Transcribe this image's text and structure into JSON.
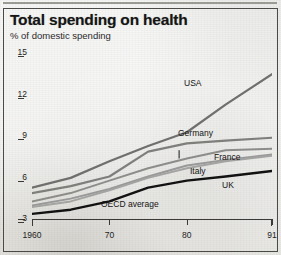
{
  "header": {
    "title": "Total spending on health",
    "subtitle": "% of domestic spending"
  },
  "chart_data": {
    "type": "line",
    "title": "Total spending on health",
    "subtitle": "% of domestic spending",
    "xlabel": "",
    "ylabel": "% of domestic spending",
    "xlim": [
      1960,
      1991
    ],
    "ylim": [
      3,
      15
    ],
    "yticks": [
      15,
      12,
      9,
      6,
      3
    ],
    "ytick_labels": [
      "15",
      "12",
      "9",
      "6",
      "3"
    ],
    "xticks": [
      1960,
      1970,
      1980,
      1991
    ],
    "xtick_labels": [
      "1960",
      "70",
      "80",
      "91"
    ],
    "grid": false,
    "legend_position": "inline-right",
    "annotations": [
      {
        "text": "OECD average",
        "x": 1979,
        "y": 7.3,
        "leader_to_y": 7.9
      }
    ],
    "series": [
      {
        "name": "USA",
        "color": "#6f6f6d",
        "width": 2.2,
        "x": [
          1960,
          1965,
          1970,
          1975,
          1980,
          1985,
          1991
        ],
        "values": [
          5.2,
          5.9,
          7.1,
          8.2,
          9.2,
          11.2,
          13.4
        ]
      },
      {
        "name": "Germany",
        "color": "#7e7e7b",
        "width": 2.2,
        "x": [
          1960,
          1965,
          1970,
          1975,
          1980,
          1985,
          1991
        ],
        "values": [
          4.8,
          5.3,
          6.0,
          7.8,
          8.4,
          8.6,
          8.8
        ]
      },
      {
        "name": "France",
        "color": "#8c8c89",
        "width": 2.0,
        "x": [
          1960,
          1965,
          1970,
          1975,
          1980,
          1985,
          1991
        ],
        "values": [
          4.2,
          4.8,
          5.7,
          6.6,
          7.3,
          7.9,
          8.0
        ]
      },
      {
        "name": "Italy",
        "color": "#99999a",
        "width": 2.0,
        "x": [
          1960,
          1965,
          1970,
          1975,
          1980,
          1985,
          1991
        ],
        "values": [
          3.9,
          4.4,
          5.1,
          6.0,
          6.8,
          7.2,
          7.6
        ]
      },
      {
        "name": "OECD average",
        "color": "#a3a3a1",
        "width": 2.0,
        "x": [
          1960,
          1965,
          1970,
          1975,
          1980,
          1985,
          1991
        ],
        "values": [
          3.8,
          4.2,
          5.0,
          5.9,
          6.6,
          7.1,
          7.5
        ]
      },
      {
        "name": "UK",
        "color": "#121212",
        "width": 2.4,
        "x": [
          1960,
          1965,
          1970,
          1975,
          1980,
          1985,
          1991
        ],
        "values": [
          3.3,
          3.6,
          4.2,
          5.2,
          5.7,
          6.0,
          6.4
        ]
      }
    ],
    "series_labels": [
      {
        "name": "USA",
        "left": 184,
        "top": 78
      },
      {
        "name": "Germany",
        "left": 178,
        "top": 128
      },
      {
        "name": "France",
        "left": 214,
        "top": 152
      },
      {
        "name": "Italy",
        "left": 190,
        "top": 166
      },
      {
        "name": "UK",
        "left": 222,
        "top": 180
      },
      {
        "name": "OECD average",
        "left": 101,
        "top": 199
      }
    ]
  }
}
